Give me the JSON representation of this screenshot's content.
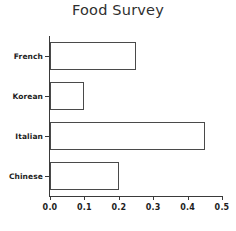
{
  "chart_data": {
    "type": "bar",
    "orientation": "horizontal",
    "title": "Food Survey",
    "xlabel": "",
    "ylabel": "",
    "categories": [
      "Chinese",
      "Italian",
      "Korean",
      "French"
    ],
    "values": [
      0.2,
      0.45,
      0.1,
      0.25
    ],
    "xlim": [
      0.0,
      0.5
    ],
    "xticks": [
      "0.0",
      "0.1",
      "0.2",
      "0.3",
      "0.4",
      "0.5"
    ],
    "xtick_values": [
      0.0,
      0.1,
      0.2,
      0.3,
      0.4,
      0.5
    ],
    "grid": false,
    "legend": false,
    "bar_fill_color": "#ffffff",
    "bar_edge_color": "#4a4a4a",
    "axis_color": "#3a3a3a",
    "background_color": "#ffffff",
    "title_color": "#2f2f2f"
  }
}
